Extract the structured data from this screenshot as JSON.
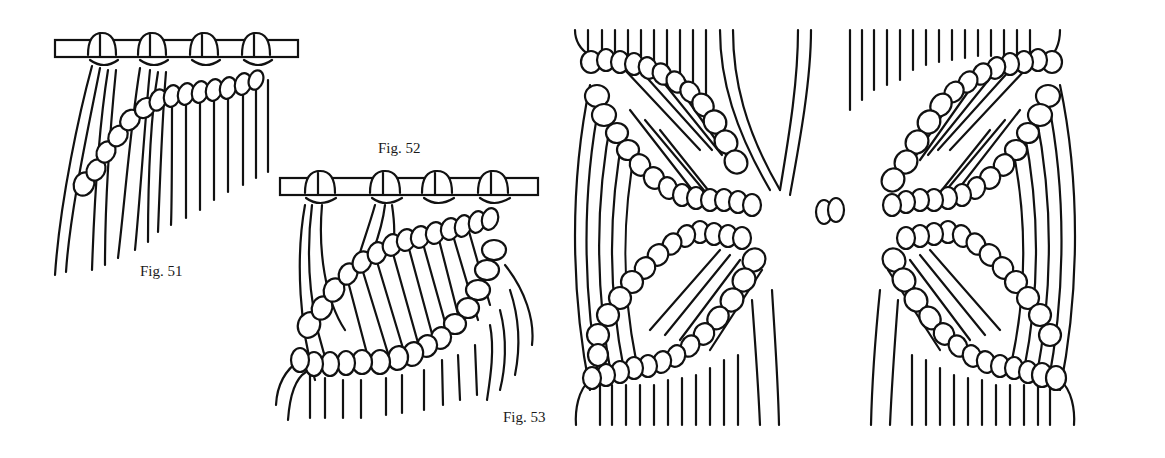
{
  "figures": [
    {
      "id": "fig51",
      "caption": "Fig. 51",
      "description": "Single diagonal row of double half hitches over cords mounted on a dowel"
    },
    {
      "id": "fig52",
      "caption": "Fig. 52",
      "description": "Two diagonal rows of double half hitches forming a diamond segment below a dowel"
    },
    {
      "id": "fig53",
      "caption": "Fig. 53",
      "description": "Symmetrical crossing diagonal rows of double half hitches meeting at a central knot"
    }
  ],
  "colors": {
    "ink": "#111111",
    "paper": "#ffffff"
  }
}
